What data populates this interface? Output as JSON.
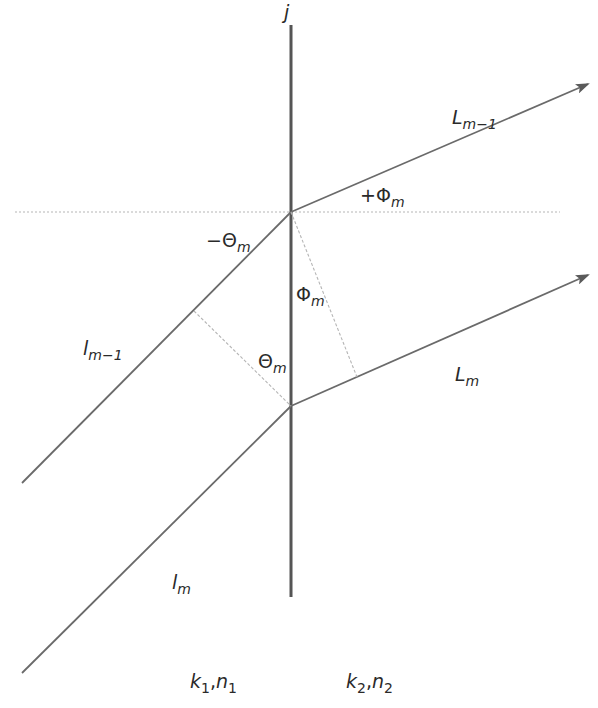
{
  "diagram": {
    "colors": {
      "line": "#6a6a6a",
      "vertical": "#555555",
      "dashed": "#b5b5b5",
      "text": "#2a2a2a",
      "background": "#ffffff"
    },
    "labels": {
      "interface": {
        "base": "j"
      },
      "L_m_minus_1": {
        "base": "L",
        "sub": "m−1"
      },
      "plus_phi_m": {
        "base": "+Φ",
        "sub": "m"
      },
      "minus_theta_m": {
        "base": "−Θ",
        "sub": "m"
      },
      "phi_m": {
        "base": "Φ",
        "sub": "m"
      },
      "theta_m": {
        "base": "Θ",
        "sub": "m"
      },
      "l_m_minus_1": {
        "base": "l",
        "sub": "m−1"
      },
      "L_m": {
        "base": "L",
        "sub": "m"
      },
      "l_m": {
        "base": "l",
        "sub": "m"
      },
      "medium_1": {
        "k": "k",
        "k_sub": "1",
        "sep": ",",
        "n": "n",
        "n_sub": "1"
      },
      "medium_2": {
        "k": "k",
        "k_sub": "2",
        "sep": ",",
        "n": "n",
        "n_sub": "2"
      }
    },
    "geometry": {
      "vertical_line": {
        "x": 291,
        "y1": 25,
        "y2": 597
      },
      "horizontal_dotted": {
        "y": 212,
        "x1": 15,
        "x2": 560
      },
      "upper_junction": [
        291,
        212
      ],
      "lower_junction": [
        291,
        406
      ],
      "incident_upper": {
        "from": [
          22,
          483
        ],
        "to": [
          291,
          212
        ]
      },
      "incident_lower": {
        "from": [
          22,
          673
        ],
        "to": [
          291,
          406
        ]
      },
      "refracted_upper": {
        "from": [
          291,
          212
        ],
        "to": [
          588,
          84
        ]
      },
      "refracted_lower": {
        "from": [
          291,
          406
        ],
        "to": [
          588,
          275
        ]
      },
      "perp_incident": {
        "from": [
          194,
          311
        ],
        "to": [
          291,
          406
        ]
      },
      "perp_refracted": {
        "from": [
          291,
          212
        ],
        "to": [
          357,
          377
        ]
      }
    }
  }
}
